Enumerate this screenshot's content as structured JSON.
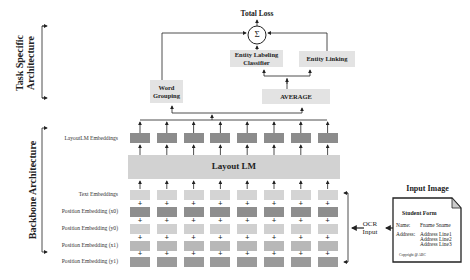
{
  "brackets": {
    "task_specific": {
      "line1": "Task Specific",
      "line2": "Architecture"
    },
    "backbone": {
      "label": "Backbone Architecture"
    }
  },
  "task_head": {
    "total_loss": "Total Loss",
    "sum_symbol": "Σ",
    "word_grouping": {
      "line1": "Word",
      "line2": "Grouping"
    },
    "entity_labeling": {
      "line1": "Entity Labeling",
      "line2": "Classifier"
    },
    "entity_linking": "Entity Linking",
    "average": "AVERAGE"
  },
  "backbone": {
    "layoutlm_embeddings_label": "LayoutLM Embeddings",
    "model_label": "Layout LM",
    "token_count": 8,
    "input_rows": [
      {
        "label": "Text Embeddings",
        "color": "#d4d4d4"
      },
      {
        "label": "Position Embedding (x0)",
        "color": "#8e8e8e"
      },
      {
        "label": "Position Embedding (y0)",
        "color": "#d0d0d0"
      },
      {
        "label": "Position Embedding (x1)",
        "color": "#b8b8b8"
      },
      {
        "label": "Position Embedding (y1)",
        "color": "#9a9a9a"
      }
    ],
    "output_color": "#8c8c8c",
    "model_color": "#d2d2d2",
    "plus_symbol": "+"
  },
  "ocr": {
    "line1": "OCR",
    "line2": "Input"
  },
  "input_image": {
    "title": "Input Image",
    "form_title": "Student Form",
    "name_label": "Name:",
    "name_value": "Fname Sname",
    "address_label": "Address:",
    "address_lines": [
      "Address Line1",
      "Address Line2",
      "Address Line3"
    ],
    "footer": "Copyright @ ABC"
  }
}
